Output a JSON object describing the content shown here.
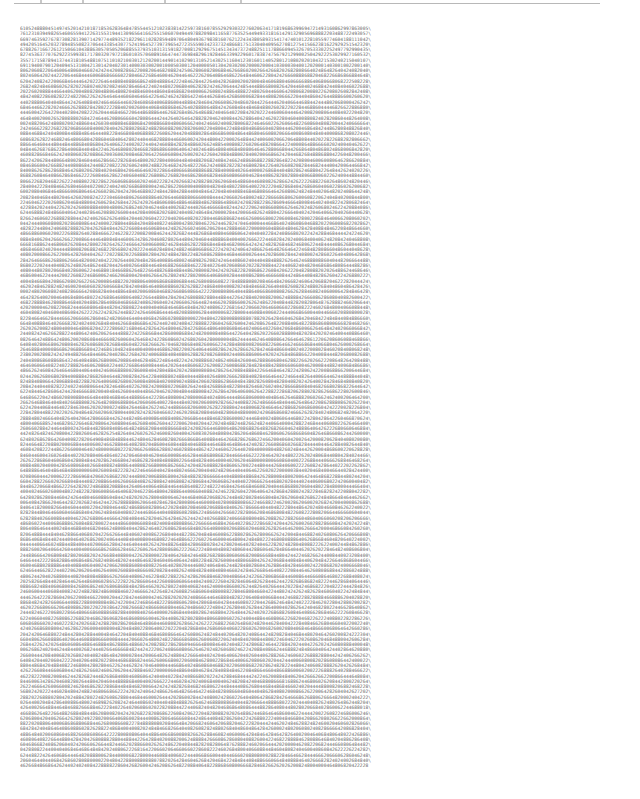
{
  "document": {
    "type": "terminal-number-dump",
    "line_continuation_char": "\\",
    "visible_lines_estimate": 141,
    "chars_per_line": 125,
    "known_lines": [
      "61052488804514974520142101871853628364847855445121023838142259738160785529293032276020634171819686399694721493160862997863005975284036113670417314",
      "76123103949826546065594122631553194413096564166255150607049449788209841165877635254494933181614291329056968882203488722493057967948949571533157491",
      "66974635927678730828139071429774489352182296110282859489706480493679838160762122434380589315417474010122810559774604188111042610153757253193043043",
      "49420516452032789485508237064433854307752419645273973965427235559034233732486681751330404095627081275415662381622929251542320827406537864008898329",
      "67882671667261215066104388630570505206885537935103131591827008129296751451343473724882511178866094532670533302252497792990435070562700429404525459",
      "82745363770762922359938171780320797218601035706089166474473698482961928466339922960178387475679212990025042922253029927160532744684445899860396",
      "35571715878941374431810548810751101021003012120200144901410290131052143025116041230160114052801210802020104321530240215040107004400001053403100",
      "69119400790120409451310042130142040230140003030020010005030012040000501304203020020000200041030003040012020001403001002200140042002001001140050"
    ],
    "colors": {
      "background": "#ffffff",
      "text": "#6a6a6a",
      "rule": "#b8b8b8"
    }
  }
}
